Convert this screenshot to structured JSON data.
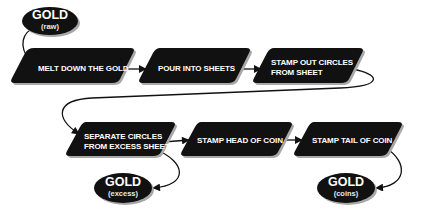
{
  "diagram": {
    "type": "flowchart",
    "colors": {
      "node_fill": "#111111",
      "shadow": "#9a9a9a",
      "text": "#ffffff",
      "connector": "#111111",
      "background": "#ffffff"
    },
    "terminals": {
      "raw": {
        "title": "GOLD",
        "subtitle": "(raw)"
      },
      "excess": {
        "title": "GOLD",
        "subtitle": "(excess)"
      },
      "coins": {
        "title": "GOLD",
        "subtitle": "(coins)"
      }
    },
    "steps": [
      {
        "line1": "MELT DOWN THE GOLD",
        "line2": ""
      },
      {
        "line1": "POUR INTO SHEETS",
        "line2": ""
      },
      {
        "line1": "STAMP OUT CIRCLES",
        "line2": "FROM SHEET"
      },
      {
        "line1": "SEPARATE CIRCLES",
        "line2": "FROM EXCESS SHEET"
      },
      {
        "line1": "STAMP HEAD OF COIN",
        "line2": ""
      },
      {
        "line1": "STAMP TAIL OF COIN",
        "line2": ""
      }
    ],
    "edges": [
      {
        "from": "GOLD (raw)",
        "to": "MELT DOWN THE GOLD"
      },
      {
        "from": "MELT DOWN THE GOLD",
        "to": "POUR INTO SHEETS"
      },
      {
        "from": "POUR INTO SHEETS",
        "to": "STAMP OUT CIRCLES FROM SHEET"
      },
      {
        "from": "STAMP OUT CIRCLES FROM SHEET",
        "to": "SEPARATE CIRCLES FROM EXCESS SHEET"
      },
      {
        "from": "SEPARATE CIRCLES FROM EXCESS SHEET",
        "to": "STAMP HEAD OF COIN"
      },
      {
        "from": "SEPARATE CIRCLES FROM EXCESS SHEET",
        "to": "GOLD (excess)"
      },
      {
        "from": "STAMP HEAD OF COIN",
        "to": "STAMP TAIL OF COIN"
      },
      {
        "from": "STAMP TAIL OF COIN",
        "to": "GOLD (coins)"
      }
    ]
  }
}
